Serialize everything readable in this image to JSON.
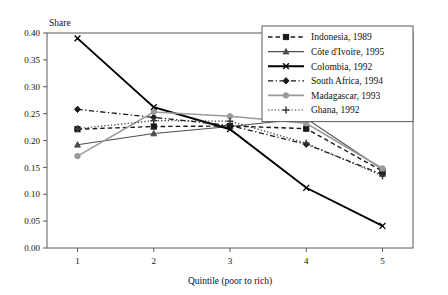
{
  "chart_data": {
    "type": "line",
    "title": "",
    "xlabel": "Quintile (poor to rich)",
    "ylabel": "Share",
    "categories": [
      "1",
      "2",
      "3",
      "4",
      "5"
    ],
    "x": [
      1,
      2,
      3,
      4,
      5
    ],
    "xlim": [
      0.6,
      5.4
    ],
    "ylim": [
      0.0,
      0.4
    ],
    "ytick_labels": [
      "0.00",
      "0.05",
      "0.10",
      "0.15",
      "0.20",
      "0.25",
      "0.30",
      "0.35",
      "0.40"
    ],
    "ytick_values": [
      0.0,
      0.05,
      0.1,
      0.15,
      0.2,
      0.25,
      0.3,
      0.35,
      0.4
    ],
    "xtick_labels": [
      "1",
      "2",
      "3",
      "4",
      "5"
    ],
    "grid": false,
    "legend_position": "top-right",
    "series": [
      {
        "name": "Indonesia, 1989",
        "values": [
          0.221,
          0.226,
          0.227,
          0.222,
          0.143
        ],
        "color": "#1a1a1a",
        "line_style": "dashed",
        "marker": "square",
        "line_width": 1.4
      },
      {
        "name": "Côte d'Ivoire, 1995",
        "values": [
          0.192,
          0.213,
          0.226,
          0.241,
          0.146
        ],
        "color": "#4d4d4d",
        "line_style": "solid",
        "marker": "triangle",
        "line_width": 1.1
      },
      {
        "name": "Colombia, 1992",
        "values": [
          0.39,
          0.262,
          0.221,
          0.112,
          0.041
        ],
        "color": "#000000",
        "line_style": "solid",
        "marker": "x",
        "line_width": 1.9
      },
      {
        "name": "South Africa, 1994",
        "values": [
          0.258,
          0.243,
          0.228,
          0.193,
          0.137
        ],
        "color": "#1a1a1a",
        "line_style": "dash-dot",
        "marker": "diamond",
        "line_width": 1.3
      },
      {
        "name": "Madagascar, 1993",
        "values": [
          0.171,
          0.253,
          0.245,
          0.232,
          0.148
        ],
        "color": "#9a9a9a",
        "line_style": "solid",
        "marker": "circle",
        "line_width": 1.6
      },
      {
        "name": "Ghana, 1992",
        "values": [
          0.222,
          0.237,
          0.236,
          0.195,
          0.134
        ],
        "color": "#3a3a3a",
        "line_style": "dotted",
        "marker": "plus",
        "line_width": 1.2
      }
    ]
  }
}
